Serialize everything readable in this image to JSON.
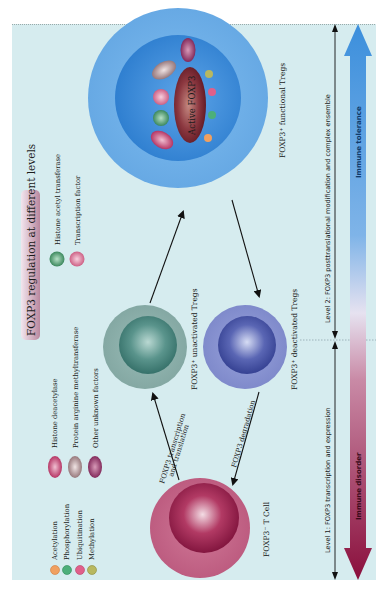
{
  "title": "FOXP3  regulation at different levels",
  "legend": {
    "modifications": [
      {
        "abbr": "Ac",
        "label": "Acetylation",
        "color": "#f0a060"
      },
      {
        "abbr": "P",
        "label": "Phosphorylation",
        "color": "#4caf7a"
      },
      {
        "abbr": "Ub",
        "label": "Ubiquitination",
        "color": "#e0608a"
      },
      {
        "abbr": "Me",
        "label": "Methylation",
        "color": "#b8b860"
      }
    ],
    "factors": [
      {
        "abbr": "HDAC",
        "label": "Histone deacetylase",
        "color": "#b8305f"
      },
      {
        "abbr": "PRMT",
        "label": "Protein arginine methyltransferase",
        "color": "#a08a8a"
      },
      {
        "abbr": "OTHERS",
        "label": "Other unknown factors",
        "color": "#8a2a5a"
      },
      {
        "abbr": "HAT",
        "label": "Histone acetyl transferase",
        "color": "#3f8f62"
      },
      {
        "abbr": "TF",
        "label": "Transcription factor",
        "color": "#d56a8a"
      }
    ]
  },
  "cells": {
    "t_cell": {
      "label": "FOXP3⁻ T Cell",
      "color": "#b0305e"
    },
    "unactivated": {
      "label": "FOXP3⁺ unactivated Tregs",
      "color": "#4e8c86"
    },
    "deactivated": {
      "label": "FOXP3⁺ deactivated Tregs",
      "color": "#4a5aa6"
    },
    "functional": {
      "label": "FOXP3⁺ functional Tregs",
      "color": "#3a8fd8",
      "core": "Active  FOXP3"
    }
  },
  "arrows": {
    "transcription": {
      "line1": "FOXP3  transcription",
      "line2": "and translation"
    },
    "degradation": "FOXP3 degradation"
  },
  "levels": {
    "level1": "Level 1: FOXP3 transcription and expression",
    "level2": "Level 2: FOXP3 posttranslational modification and complex ensemble"
  },
  "outcomes": {
    "tolerance": "Immune tolerance",
    "disorder": "Immune disorder",
    "tolerance_color": "#3c8fdc",
    "disorder_color": "#8a0f3c"
  },
  "colors": {
    "panel_bg": "#d6ecef"
  }
}
